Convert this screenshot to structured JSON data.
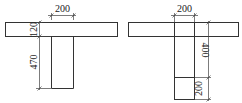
{
  "diagram": {
    "type": "T-beam cross-sections",
    "left_section": {
      "web_width_label": "200",
      "flange_thickness_label": "120",
      "web_height_label": "470"
    },
    "right_section": {
      "web_width_label": "200",
      "upper_height_label": "400",
      "lower_height_label": "200"
    }
  }
}
